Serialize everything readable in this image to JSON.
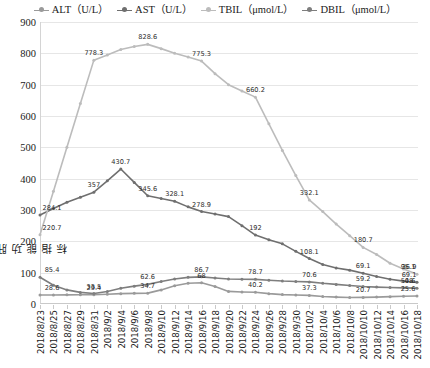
{
  "chart_data": {
    "type": "line",
    "title": "",
    "xlabel": "",
    "ylabel": "肝功能指标",
    "ylim": [
      0,
      900
    ],
    "ytick_step": 100,
    "yticks": [
      "0",
      "100",
      "200",
      "300",
      "400",
      "500",
      "600",
      "700",
      "800",
      "900"
    ],
    "grid": true,
    "legend_position": "top-center",
    "categories": [
      "2018/8/23",
      "2018/8/25",
      "2018/8/27",
      "2018/8/29",
      "2018/8/31",
      "2018/9/2",
      "2018/9/4",
      "2018/9/6",
      "2018/9/8",
      "2018/9/10",
      "2018/9/12",
      "2018/9/14",
      "2018/9/16",
      "2018/9/18",
      "2018/9/20",
      "2018/9/22",
      "2018/9/24",
      "2018/9/26",
      "2018/9/28",
      "2018/9/30",
      "2018/10/2",
      "2018/10/4",
      "2018/10/6",
      "2018/10/8",
      "2018/10/10",
      "2018/10/12",
      "2018/10/14",
      "2018/10/16",
      "2018/10/18"
    ],
    "series": [
      {
        "name": "ALT（U/L）",
        "color": "#9a9a9a",
        "label_indices": [
          0,
          4,
          8,
          12,
          16,
          20,
          24,
          28
        ],
        "labels": [
          "28.6",
          "29.4",
          "34.7",
          "68",
          "40.2",
          "37.3",
          "20.7",
          "25.6"
        ],
        "values": [
          28.6,
          28.9,
          29.2,
          29.3,
          29.4,
          31.0,
          33.0,
          34.0,
          34.7,
          45.0,
          58.0,
          66.0,
          68.0,
          56.0,
          40.2,
          38.5,
          37.3,
          33.0,
          30.0,
          28.5,
          27.4,
          24.0,
          22.0,
          20.7,
          21.0,
          22.0,
          23.5,
          24.5,
          25.6
        ]
      },
      {
        "name": "AST（U/L）",
        "color": "#6f6f6f",
        "label_indices": [
          0,
          4,
          6,
          8,
          10,
          12,
          16,
          20,
          24,
          28
        ],
        "labels": [
          "284.1",
          "357",
          "430.7",
          "345.6",
          "328.1",
          "278.9",
          "192",
          "108.1",
          "69.1"
        ],
        "values": [
          284.1,
          305.0,
          325.0,
          341.0,
          357.0,
          393.0,
          430.7,
          388.0,
          345.6,
          337.0,
          328.1,
          310.0,
          295.0,
          287.0,
          278.9,
          250.0,
          220.0,
          205.0,
          192.0,
          168.0,
          145.0,
          126.0,
          115.0,
          108.1,
          98.0,
          88.0,
          79.0,
          73.0,
          69.1
        ]
      },
      {
        "name": "TBIL（μmol/L）",
        "color": "#bcbcbc",
        "label_indices": [
          0,
          4,
          8,
          12,
          16,
          20,
          24,
          28
        ],
        "labels": [
          "220.7",
          "778.3",
          "828.6",
          "775.3",
          "660.2",
          "332.1",
          "180.7",
          "95.1"
        ],
        "values": [
          220.7,
          360.0,
          500.0,
          640.0,
          778.3,
          795.0,
          812.0,
          822.0,
          828.6,
          815.0,
          800.0,
          788.0,
          775.3,
          735.0,
          700.0,
          680.0,
          660.2,
          575.0,
          490.0,
          410.0,
          332.1,
          295.0,
          255.0,
          218.0,
          180.7,
          158.0,
          130.0,
          112.0,
          95.1
        ]
      },
      {
        "name": "DBIL（μmol/L）",
        "color": "#7e7e7e",
        "label_indices": [
          0,
          4,
          8,
          12,
          16,
          20,
          24,
          28
        ],
        "labels": [
          "85.4",
          "33.5",
          "62.6",
          "86.7",
          "78.7",
          "70.6",
          "59.2",
          "50.6"
        ],
        "values": [
          85.4,
          60.0,
          45.0,
          37.0,
          33.5,
          40.0,
          50.0,
          57.0,
          62.6,
          72.0,
          80.0,
          85.0,
          86.7,
          83.0,
          80.0,
          79.2,
          78.7,
          76.0,
          73.5,
          72.0,
          70.6,
          66.0,
          62.5,
          59.2,
          56.0,
          54.0,
          52.5,
          51.5,
          50.6
        ]
      }
    ],
    "extra_labels": [
      {
        "series": "TBIL（μmol/L）",
        "index": 28,
        "text": "36.9"
      },
      {
        "series": "AST（U/L）",
        "index": 28,
        "text": "69.1"
      },
      {
        "series": "DBIL（μmol/L）",
        "index": 28,
        "text": "48"
      }
    ]
  }
}
